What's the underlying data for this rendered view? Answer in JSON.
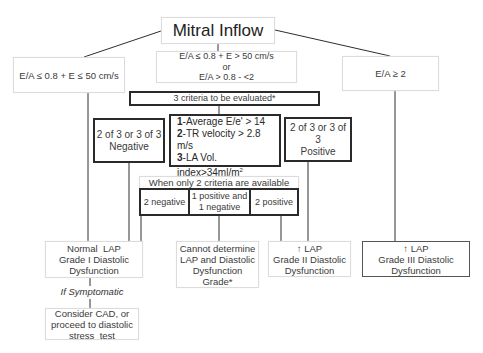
{
  "root": {
    "label": "Mitral Inflow"
  },
  "branches": {
    "left": {
      "label": "E/A ≤ 0.8 + E ≤ 50 cm/s"
    },
    "center": {
      "line1": "E/A ≤ 0.8 + E > 50 cm/s",
      "line2": "or",
      "line3": "E/A > 0.8 - <2"
    },
    "right": {
      "label": "E/A ≥ 2"
    }
  },
  "criteria_header": {
    "label": "3 criteria to be evaluated*"
  },
  "criteria": [
    {
      "num": "1",
      "text": "-Average E/e' > 14"
    },
    {
      "num": "2",
      "text": "-TR velocity > 2.8 m/s"
    },
    {
      "num": "3",
      "text": "-LA Vol. index>34ml/m",
      "sup": "2"
    }
  ],
  "negative": {
    "line1": "2 of 3 or 3 of 3",
    "line2": "Negative"
  },
  "positive": {
    "line1": "2 of 3 or 3 of 3",
    "line2": "Positive"
  },
  "two_criteria": {
    "header": "When only 2 criteria are available",
    "options": [
      {
        "line1": "2 negative",
        "line2": ""
      },
      {
        "line1": "1 positive and",
        "line2": "1 negative"
      },
      {
        "line1": "2 positive",
        "line2": ""
      }
    ]
  },
  "outcomes": {
    "normal": {
      "line1": "Normal  LAP",
      "line2": "Grade I Diastolic",
      "line3": "Dysfunction"
    },
    "cannot": {
      "line1": "Cannot determine",
      "line2": "LAP and Diastolic",
      "line3": "Dysfunction",
      "line4": "Grade*"
    },
    "grade2": {
      "line1": "↑ LAP",
      "line2": "Grade II Diastolic",
      "line3": "Dysfunction"
    },
    "grade3": {
      "line1": "↑ LAP",
      "line2": "Grade III Diastolic",
      "line3": "Dysfunction"
    }
  },
  "symptomatic": {
    "label": "If Symptomatic"
  },
  "followup": {
    "line1": "Consider CAD, or",
    "line2": "proceed to diastolic",
    "line3": "stress  test"
  }
}
